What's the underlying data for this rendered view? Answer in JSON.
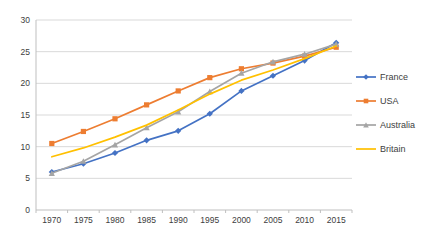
{
  "chart_data": {
    "type": "line",
    "title": "",
    "xlabel": "",
    "ylabel": "",
    "categories": [
      "1970",
      "1975",
      "1980",
      "1985",
      "1990",
      "1995",
      "2000",
      "2005",
      "2010",
      "2015"
    ],
    "series": [
      {
        "name": "France",
        "color": "#4472C4",
        "marker": "diamond",
        "values": [
          6.0,
          7.3,
          9.0,
          11.0,
          12.5,
          15.2,
          18.8,
          21.2,
          23.6,
          26.4
        ]
      },
      {
        "name": "USA",
        "color": "#ED7D31",
        "marker": "square",
        "values": [
          10.5,
          12.4,
          14.4,
          16.6,
          18.8,
          20.9,
          22.3,
          23.2,
          24.3,
          25.7
        ]
      },
      {
        "name": "Australia",
        "color": "#A5A5A5",
        "marker": "triangle",
        "values": [
          5.8,
          7.7,
          10.3,
          13.0,
          15.5,
          18.7,
          21.6,
          23.4,
          24.6,
          26.2
        ]
      },
      {
        "name": "Britain",
        "color": "#FFC000",
        "marker": "none",
        "values": [
          8.4,
          9.8,
          11.5,
          13.4,
          15.8,
          18.3,
          20.5,
          22.1,
          23.9,
          25.9
        ]
      }
    ],
    "ylim": [
      0,
      30
    ],
    "ytick_step": 5,
    "ytick_labels": [
      "0",
      "5",
      "10",
      "15",
      "20",
      "25",
      "30"
    ],
    "grid": true,
    "legend_position": "right",
    "legend_labels": [
      "France",
      "USA",
      "Australia",
      "Britain"
    ]
  },
  "colors": {
    "background": "#FFFFFF",
    "gridline": "#D9D9D9",
    "axis_line": "#BFBFBF",
    "tick_label": "#404040",
    "legend_label": "#404040"
  }
}
